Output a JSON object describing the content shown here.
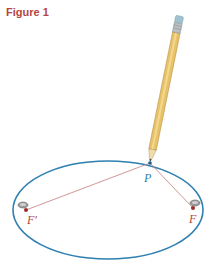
{
  "figure": {
    "title": "Figure 1"
  },
  "diagram": {
    "labels": {
      "point": "P",
      "focus_left": "F′",
      "focus_right": "F"
    },
    "colors": {
      "title": "#b5463f",
      "ellipse": "#2f7fb0",
      "string": "#c98a8a",
      "label_point": "#2f7fb0",
      "label_focus": "#b5463f",
      "pencil_body": "#e8c26a",
      "pencil_eraser": "#9fc2cc"
    }
  }
}
